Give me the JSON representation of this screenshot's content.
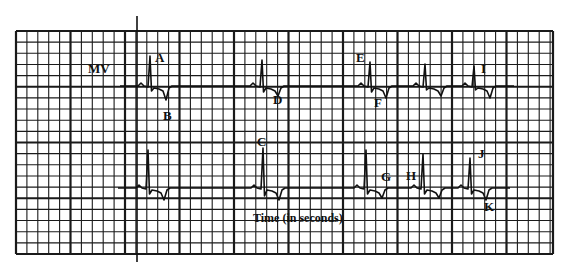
{
  "chart_data": {
    "type": "line",
    "title": "",
    "ylabel": "MV",
    "xlabel": "Time (in seconds)",
    "grid": true,
    "grid_spec": {
      "left": 16,
      "top": 31,
      "right": 553,
      "bottom": 254,
      "minor_step_x": 10.9,
      "minor_step_y": 11.15,
      "major_every": 5
    },
    "marker_line_x": 137,
    "strips": [
      {
        "name": "upper-strip",
        "baseline_y": 86,
        "beats": [
          {
            "label": "A",
            "x": 150,
            "r_height": 30,
            "s_depth": 5,
            "t_dip": 14
          },
          {
            "label": "D",
            "x": 262,
            "r_height": 26,
            "s_depth": 6,
            "t_dip": 10
          },
          {
            "label": "E/F",
            "x": 370,
            "r_height": 24,
            "s_depth": 6,
            "t_dip": 12
          },
          {
            "label": "",
            "x": 425,
            "r_height": 22,
            "s_depth": 4,
            "t_dip": 10
          },
          {
            "label": "I",
            "x": 474,
            "r_height": 20,
            "s_depth": 4,
            "t_dip": 12
          }
        ]
      },
      {
        "name": "lower-strip",
        "baseline_y": 188,
        "beats": [
          {
            "label": "",
            "x": 148,
            "r_height": 38,
            "s_depth": 6,
            "t_dip": 12
          },
          {
            "label": "C",
            "x": 263,
            "r_height": 40,
            "s_depth": 8,
            "t_dip": 12
          },
          {
            "label": "G",
            "x": 366,
            "r_height": 38,
            "s_depth": 6,
            "t_dip": 10
          },
          {
            "label": "H",
            "x": 423,
            "r_height": 34,
            "s_depth": 6,
            "t_dip": 10
          },
          {
            "label": "J",
            "x": 470,
            "r_height": 30,
            "s_depth": 6,
            "t_dip": 12
          }
        ]
      }
    ],
    "annotations": [
      {
        "text": "MV",
        "x": 88,
        "y": 73
      },
      {
        "text": "A",
        "x": 155,
        "y": 62
      },
      {
        "text": "B",
        "x": 163,
        "y": 120
      },
      {
        "text": "C",
        "x": 257,
        "y": 146
      },
      {
        "text": "D",
        "x": 273,
        "y": 104
      },
      {
        "text": "E",
        "x": 356,
        "y": 62
      },
      {
        "text": "F",
        "x": 374,
        "y": 107
      },
      {
        "text": "G",
        "x": 381,
        "y": 181
      },
      {
        "text": "H",
        "x": 406,
        "y": 180
      },
      {
        "text": "I",
        "x": 481,
        "y": 73
      },
      {
        "text": "J",
        "x": 478,
        "y": 158
      },
      {
        "text": "K",
        "x": 484,
        "y": 211
      },
      {
        "text": "Time (in seconds)",
        "x": 253,
        "y": 222
      }
    ]
  }
}
